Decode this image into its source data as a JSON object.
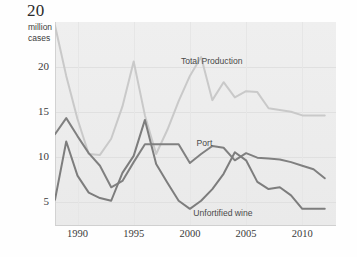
{
  "header": {
    "title": "20",
    "subtitle": "million\ncases",
    "subtitle_line1": "million",
    "subtitle_line2": "cases"
  },
  "colors": {
    "plot_background": "#eeeeee",
    "gridline": "#e0e0e0",
    "total_production": "#c9c9c9",
    "port": "#808080",
    "unfortified_wine": "#7d7d7d",
    "tick_text": "#3a3a3a"
  },
  "chart_data": {
    "type": "line",
    "title": "20",
    "subtitle": "million cases",
    "xlabel": "",
    "ylabel": "million cases",
    "xlim": [
      1988,
      2013
    ],
    "ylim": [
      2.4,
      25
    ],
    "yticks": [
      5,
      10,
      15,
      20
    ],
    "xticks": [
      1990,
      1995,
      2000,
      2005,
      2010
    ],
    "grid": "horizontal",
    "legend": "inline-labels",
    "x": [
      1988,
      1989,
      1990,
      1991,
      1992,
      1993,
      1994,
      1995,
      1996,
      1997,
      1998,
      1999,
      2000,
      2001,
      2002,
      2003,
      2004,
      2005,
      2006,
      2007,
      2008,
      2009,
      2010,
      2011,
      2012
    ],
    "series": [
      {
        "name": "Total Production",
        "color": "#c9c9c9",
        "label_x": 1999.2,
        "label_y": 20.6,
        "values": [
          24.6,
          19.0,
          14.2,
          10.3,
          10.2,
          12.0,
          15.6,
          20.6,
          14.6,
          10.3,
          13.0,
          16.2,
          19.0,
          21.1,
          16.3,
          18.3,
          16.6,
          17.3,
          17.2,
          15.4,
          15.2,
          15.0,
          14.6,
          14.6,
          14.6
        ]
      },
      {
        "name": "Port",
        "color": "#808080",
        "label_x": 2000.6,
        "label_y": 11.4,
        "values": [
          12.5,
          14.3,
          12.3,
          10.4,
          9.0,
          6.6,
          7.3,
          9.4,
          11.4,
          11.4,
          11.4,
          11.4,
          9.3,
          10.3,
          11.2,
          11.0,
          9.6,
          10.4,
          9.9,
          9.8,
          9.7,
          9.4,
          9.0,
          8.6,
          7.6
        ]
      },
      {
        "name": "Unfortified wine",
        "color": "#7d7d7d",
        "label_x": 2000.3,
        "label_y": 3.6,
        "values": [
          5.2,
          11.7,
          7.9,
          6.0,
          5.4,
          5.1,
          8.2,
          10.1,
          14.1,
          9.2,
          7.1,
          5.1,
          4.2,
          5.1,
          6.4,
          8.1,
          10.5,
          9.6,
          7.2,
          6.4,
          6.6,
          5.7,
          4.2,
          4.2,
          4.2
        ]
      }
    ]
  },
  "axis": {
    "ylabels": [
      "20",
      "15",
      "10",
      "5"
    ],
    "xlabels": [
      "1990",
      "1995",
      "2000",
      "2005",
      "2010"
    ]
  },
  "series_labels": {
    "total_production": "Total Production",
    "port": "Port",
    "unfortified_wine": "Unfortified wine"
  }
}
